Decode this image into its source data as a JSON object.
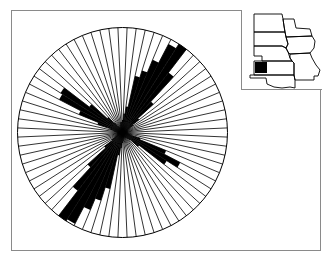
{
  "chart_data": {
    "type": "rose",
    "title": "",
    "sector_width_deg": 5,
    "sector_count": 72,
    "center_px": [
      122.5,
      132.5
    ],
    "radius_px": 105,
    "azimuth_deg": [
      0,
      5,
      10,
      15,
      20,
      25,
      30,
      35,
      40,
      45,
      50,
      55,
      60,
      65,
      70,
      75,
      80,
      85,
      90,
      95,
      100,
      105,
      110,
      115,
      120,
      125,
      130,
      135,
      140,
      145,
      150,
      155,
      160,
      165,
      170,
      175,
      180,
      185,
      190,
      195,
      200,
      205,
      210,
      215,
      220,
      225,
      230,
      235,
      240,
      245,
      250,
      255,
      260,
      265,
      270,
      275,
      280,
      285,
      290,
      295,
      300,
      305,
      310,
      315,
      320,
      325,
      330,
      335,
      340,
      345,
      350,
      355
    ],
    "relative_length": [
      0.12,
      0.18,
      0.25,
      0.55,
      0.62,
      0.75,
      0.95,
      1.0,
      0.72,
      0.4,
      0.2,
      0.12,
      0.08,
      0.06,
      0.05,
      0.05,
      0.05,
      0.05,
      0.05,
      0.05,
      0.06,
      0.08,
      0.18,
      0.45,
      0.62,
      0.5,
      0.2,
      0.1,
      0.08,
      0.06,
      0.06,
      0.05,
      0.05,
      0.05,
      0.06,
      0.08,
      0.1,
      0.15,
      0.22,
      0.55,
      0.68,
      0.8,
      0.98,
      1.0,
      0.7,
      0.45,
      0.22,
      0.12,
      0.08,
      0.06,
      0.05,
      0.05,
      0.05,
      0.05,
      0.05,
      0.06,
      0.08,
      0.12,
      0.25,
      0.45,
      0.68,
      0.7,
      0.4,
      0.2,
      0.12,
      0.08,
      0.06,
      0.05,
      0.06,
      0.08,
      0.1,
      0.1
    ],
    "grid": {
      "spokes": true,
      "outer_circle": true
    },
    "legend": null,
    "inset_map": {
      "states": [
        "ND",
        "SD",
        "NE",
        "KS",
        "OK",
        "MN",
        "IA",
        "MO"
      ],
      "highlight": "southwest Kansas / Oklahoma panhandle"
    }
  },
  "colors": {
    "fill": "#000000",
    "spoke": "#000000",
    "frame": "#8a8a8a",
    "background": "#ffffff"
  }
}
